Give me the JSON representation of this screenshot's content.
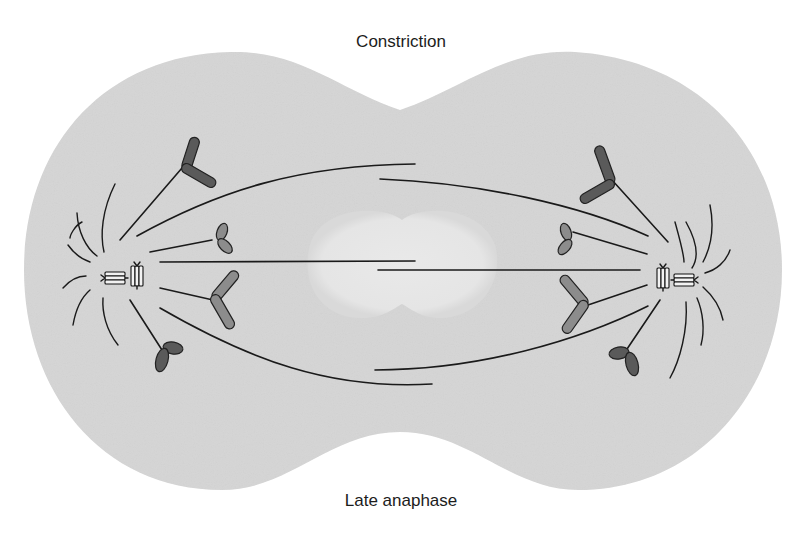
{
  "figure": {
    "title_top": "Constriction",
    "title_bottom": "Late anaphase",
    "stage": "Late anaphase",
    "feature": "Cleavage furrow constriction"
  },
  "colors": {
    "background": "#ffffff",
    "cytoplasm": "#d5d5d5",
    "central_zone": "#e7e7e7",
    "microtubule": "#1a1a1a",
    "chromosome_dark": "#5a5a5a",
    "chromosome_light": "#8c8c8c",
    "text": "#1c1c1c"
  },
  "elements": {
    "cell_outline": "dumbbell-shaped cell with top and bottom constriction",
    "spindle_poles": [
      "left-pole",
      "right-pole"
    ],
    "chromosomes_per_side": 4,
    "centrioles_per_pole": 2
  }
}
